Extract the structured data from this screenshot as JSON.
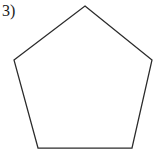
{
  "figure": {
    "label": "3)",
    "background_color": "#ffffff",
    "stroke_color": "#2b2b2b",
    "fill_color": "#ffffff",
    "stroke_width": 1.25,
    "shape": {
      "name": "pentagon",
      "sides": 5,
      "points": "85,6 152,60 132,148 38,148 14,60",
      "vertices": [
        {
          "name": "apex",
          "x": 85,
          "y": 6
        },
        {
          "name": "right",
          "x": 152,
          "y": 60
        },
        {
          "name": "bottom-right",
          "x": 132,
          "y": 148
        },
        {
          "name": "bottom-left",
          "x": 38,
          "y": 148
        },
        {
          "name": "left",
          "x": 14,
          "y": 60
        }
      ]
    }
  }
}
